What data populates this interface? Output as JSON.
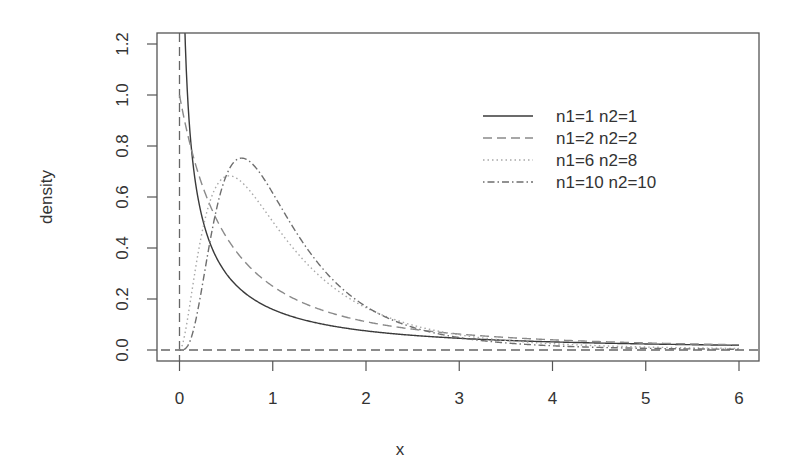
{
  "chart_data": {
    "type": "line",
    "title": "",
    "xlabel": "x",
    "ylabel": "density",
    "xlim": [
      -0.24,
      6.2
    ],
    "ylim": [
      -0.04,
      1.24
    ],
    "x_ticks": [
      0,
      1,
      2,
      3,
      4,
      5,
      6
    ],
    "x_tick_labels": [
      "0",
      "1",
      "2",
      "3",
      "4",
      "5",
      "6"
    ],
    "y_ticks": [
      0.0,
      0.2,
      0.4,
      0.6,
      0.8,
      1.0,
      1.2
    ],
    "y_tick_labels": [
      "0.0",
      "0.2",
      "0.4",
      "0.6",
      "0.8",
      "1.0",
      "1.2"
    ],
    "grid": false,
    "legend_position": "top-right",
    "reference_lines": [
      {
        "orientation": "vertical",
        "value": 0,
        "style": "dashed"
      },
      {
        "orientation": "horizontal",
        "value": 0,
        "style": "dashed"
      }
    ],
    "x_range": [
      0,
      6
    ],
    "series": [
      {
        "name": "n1=1 n2=1",
        "df1": 1,
        "df2": 1,
        "style": "solid",
        "color": "#3a3a3a",
        "x": [
          0.05,
          0.1,
          0.25,
          0.5,
          1,
          2,
          3,
          4,
          5,
          6
        ],
        "values": [
          1.36,
          0.92,
          0.51,
          0.3,
          0.16,
          0.075,
          0.046,
          0.032,
          0.024,
          0.019
        ]
      },
      {
        "name": "n1=2 n2=2",
        "df1": 2,
        "df2": 2,
        "style": "dashed",
        "color": "#8a8a8a",
        "x": [
          0,
          0.25,
          0.5,
          1,
          2,
          3,
          4,
          5,
          6
        ],
        "values": [
          1.0,
          0.64,
          0.44,
          0.25,
          0.11,
          0.0625,
          0.04,
          0.028,
          0.02
        ]
      },
      {
        "name": "n1=6 n2=8",
        "df1": 6,
        "df2": 8,
        "style": "dotted",
        "color": "#a8a8a8",
        "x": [
          0,
          0.25,
          0.5,
          0.6,
          1,
          2,
          3,
          4,
          5,
          6
        ],
        "values": [
          0,
          0.37,
          0.66,
          0.67,
          0.52,
          0.17,
          0.058,
          0.023,
          0.01,
          0.005
        ]
      },
      {
        "name": "n1=10 n2=10",
        "df1": 10,
        "df2": 10,
        "style": "dotdash",
        "color": "#6e6e6e",
        "x": [
          0,
          0.25,
          0.5,
          0.67,
          1,
          2,
          3,
          4,
          5,
          6
        ],
        "values": [
          0,
          0.14,
          0.66,
          0.75,
          0.61,
          0.16,
          0.043,
          0.014,
          0.005,
          0.002
        ]
      }
    ]
  }
}
